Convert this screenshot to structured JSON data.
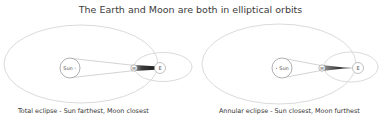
{
  "title": "The Earth and Moon are both in elliptical orbits",
  "colors": {
    "orbit_stroke": "#d4d4d4",
    "body_stroke": "#9a9a9a",
    "ray_stroke": "#b8b8b8",
    "shadow_dark": "#2b2b2b",
    "text": "#333333"
  },
  "diagrams": [
    {
      "id": "left",
      "caption": "Total eclipse - Sun farthest, Moon closest",
      "sun_label": "Sun",
      "moon_label": "M",
      "earth_label": "E"
    },
    {
      "id": "right",
      "caption": "Annular eclipse - Sun closest, Moon furthest",
      "sun_label": "Sun",
      "moon_label": "M",
      "earth_label": "E"
    }
  ]
}
